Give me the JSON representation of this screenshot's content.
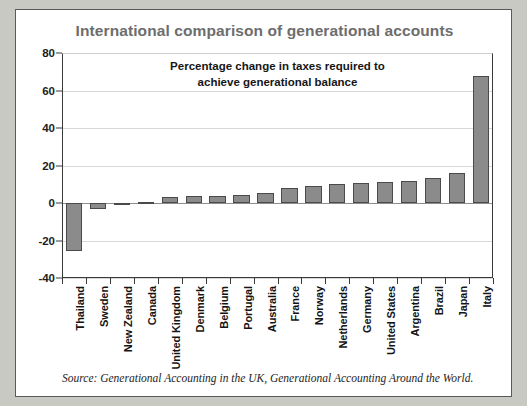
{
  "figure": {
    "title": "International comparison of generational accounts",
    "source": "Source: Generational Accounting in the UK, Generational Accounting Around the World.",
    "frame_color": "#c9c9c4",
    "panel_color": "#ffffff",
    "title_color": "#6d6d6d",
    "bar_color": "#8b8b8b",
    "bar_edge_color": "#4a4a4a"
  },
  "chart_data": {
    "type": "bar",
    "title": "Percentage change in taxes required to achieve generational balance",
    "title_line_1": "Percentage change in taxes required to",
    "title_line_2": "achieve generational balance",
    "xlabel": "",
    "ylabel": "",
    "ylim": [
      -40,
      80
    ],
    "yticks": [
      80,
      60,
      40,
      20,
      0,
      -20,
      -40
    ],
    "ytick_labels": [
      "80",
      "60",
      "40",
      "20",
      "0",
      "-20",
      "-40"
    ],
    "grid": true,
    "legend": "none",
    "categories": [
      "Thailand",
      "Sweden",
      "New Zealand",
      "Canada",
      "United Kingdom",
      "Denmark",
      "Belgium",
      "Portugal",
      "Australia",
      "France",
      "Norway",
      "Netherlands",
      "Germany",
      "United States",
      "Argentina",
      "Brazil",
      "Japan",
      "Italy"
    ],
    "values": [
      -25.5,
      -3.0,
      -0.3,
      0.5,
      3.0,
      3.5,
      4.0,
      4.5,
      5.5,
      8.0,
      9.0,
      10.0,
      10.5,
      11.0,
      11.5,
      13.5,
      16.0,
      68.0
    ]
  }
}
